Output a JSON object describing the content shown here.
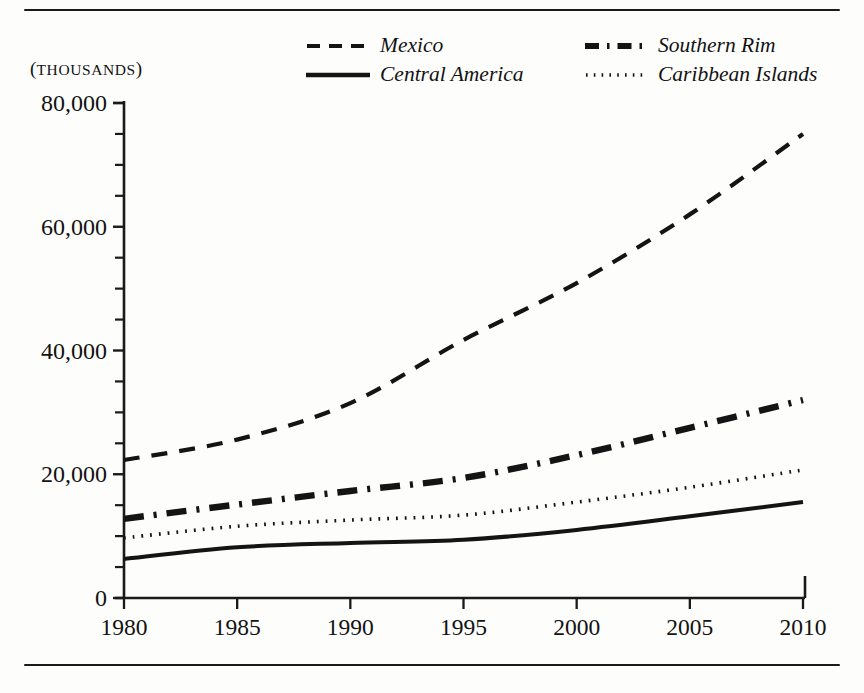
{
  "figure": {
    "units_caption_prefix": "(",
    "units_caption": "THOUSANDS",
    "units_caption_suffix": ")",
    "top_rule": "horizontal-rule",
    "bottom_rule": "horizontal-rule"
  },
  "chart_data": {
    "type": "line",
    "title": "",
    "subtitle": "",
    "xlabel": "",
    "ylabel": "(THOUSANDS)",
    "xlim": [
      1980,
      2010
    ],
    "ylim": [
      0,
      80000
    ],
    "grid": false,
    "legend_position": "top-center",
    "x": [
      1980,
      1985,
      1990,
      1995,
      2000,
      2005,
      2010
    ],
    "xtick_labels": [
      "1980",
      "1985",
      "1990",
      "1995",
      "2000",
      "2005",
      "2010"
    ],
    "ytick_labels": [
      "0",
      "20,000",
      "40,000",
      "60,000",
      "80,000"
    ],
    "ytick_values": [
      0,
      20000,
      40000,
      60000,
      80000
    ],
    "yminor_step": 5000,
    "series": [
      {
        "name": "Mexico",
        "style": "dashed",
        "color": "#141414",
        "values": [
          22300,
          25600,
          31500,
          41700,
          50900,
          62000,
          75000
        ]
      },
      {
        "name": "Central America",
        "style": "solid",
        "color": "#141414",
        "values": [
          6300,
          8200,
          8900,
          9400,
          11000,
          13200,
          15500
        ]
      },
      {
        "name": "Southern Rim",
        "style": "dash-dot",
        "color": "#141414",
        "values": [
          12800,
          15100,
          17300,
          19400,
          23100,
          27500,
          32000
        ]
      },
      {
        "name": "Caribbean Islands",
        "style": "dotted",
        "color": "#141414",
        "values": [
          9700,
          11600,
          12600,
          13400,
          15500,
          17900,
          20700
        ]
      }
    ]
  },
  "axes_geometry": {
    "left_px": 124,
    "right_px": 803,
    "top_px": 103,
    "bottom_px": 598
  }
}
